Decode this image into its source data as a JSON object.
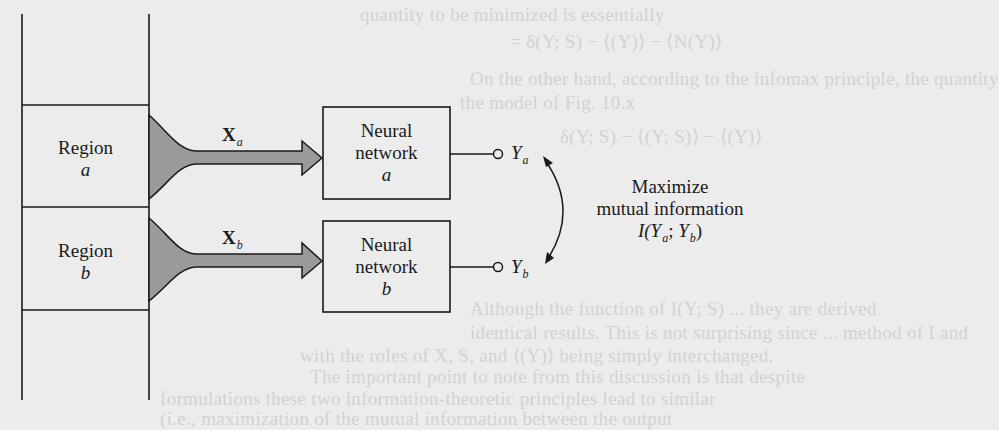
{
  "diagram": {
    "type": "block-diagram",
    "regions": [
      {
        "id": "a",
        "label": "Region",
        "var": "a"
      },
      {
        "id": "b",
        "label": "Region",
        "var": "b"
      }
    ],
    "inputs": [
      {
        "id": "a",
        "symbol": "X",
        "sub": "a"
      },
      {
        "id": "b",
        "symbol": "X",
        "sub": "b"
      }
    ],
    "networks": [
      {
        "id": "a",
        "line1": "Neural",
        "line2": "network",
        "var": "a"
      },
      {
        "id": "b",
        "line1": "Neural",
        "line2": "network",
        "var": "b"
      }
    ],
    "outputs": [
      {
        "id": "a",
        "symbol": "Y",
        "sub": "a"
      },
      {
        "id": "b",
        "symbol": "Y",
        "sub": "b"
      }
    ],
    "objective": {
      "line1": "Maximize",
      "line2": "mutual information",
      "func": "I(",
      "y1": "Y",
      "y1_sub": "a",
      "sep": "; ",
      "y2": "Y",
      "y2_sub": "b",
      "close": ")"
    },
    "colors": {
      "background": "#ececec",
      "ink": "#1a1a1a",
      "arrow_fill": "#9a9a9a"
    }
  },
  "bleed_through": [
    "quantity to be minimized is essentially",
    "= δ(Y; S) − ⟨(Y)⟩ − ⟨N(Y)⟩",
    "On the other hand, according to the infomax principle, the quantity",
    "the model of Fig. 10.x",
    "δ(Y; S) − ⟨(Y; S)⟩ − ⟨(Y)⟩",
    "Although the function of I(Y; S) ... they are derived",
    "identical results. This is not surprising since ... method of I and",
    "with the roles of X, S, and ⟨(Y)⟩ being simply interchanged.",
    "The important point to note from this discussion is that despite",
    "formulations these two information-theoretic principles lead to similar",
    "(i.e., maximization of the mutual information between the output"
  ]
}
